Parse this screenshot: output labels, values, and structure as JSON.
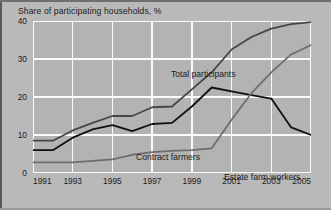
{
  "figure": {
    "title": "Share of participating households, %",
    "background_color": "#b9b9b9",
    "plot_background_color": "#b3b3b3",
    "gridline_color": "#ffffff"
  },
  "labels": {
    "total_participants": "Total participants",
    "contract_farmers": "Contract farmers",
    "estate_farm_workers": "Estate farm workers"
  },
  "chart_data": {
    "type": "line",
    "title": "Share of participating households, %",
    "xlabel": "",
    "ylabel": "Share of participating households, %",
    "xlim": [
      1991,
      2005
    ],
    "ylim": [
      0,
      40
    ],
    "yticks": [
      0,
      10,
      20,
      30,
      40
    ],
    "xticks": [
      1991,
      1993,
      1995,
      1997,
      1999,
      2001,
      2003,
      2005
    ],
    "grid": true,
    "legend": "inline-annotations",
    "x": [
      1991,
      1992,
      1993,
      1994,
      1995,
      1996,
      1997,
      1998,
      1999,
      2000,
      2001,
      2002,
      2003,
      2004,
      2005
    ],
    "series": [
      {
        "name": "Total participants",
        "color": "#474747",
        "values": [
          8.5,
          8.5,
          11.2,
          13.2,
          15.0,
          15.0,
          17.3,
          17.5,
          22.0,
          26.5,
          32.5,
          35.8,
          38.0,
          39.2,
          39.7
        ]
      },
      {
        "name": "Contract farmers",
        "color": "#111111",
        "values": [
          6.0,
          6.0,
          9.3,
          11.5,
          12.6,
          11.0,
          12.9,
          13.2,
          17.5,
          22.5,
          21.5,
          20.5,
          19.6,
          12.0,
          10.0
        ]
      },
      {
        "name": "Estate farm workers",
        "color": "#6e6e6e",
        "values": [
          2.8,
          2.8,
          2.8,
          3.2,
          3.6,
          4.8,
          5.5,
          5.8,
          6.0,
          6.5,
          14.0,
          21.0,
          26.5,
          31.2,
          33.7
        ]
      }
    ]
  }
}
